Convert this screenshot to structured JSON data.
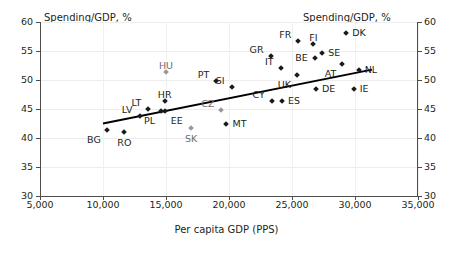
{
  "chart_data": {
    "type": "scatter",
    "title": "",
    "xlabel": "Per capita GDP (PPS)",
    "ylabel": "Spending/GDP, %",
    "ylabel_right": "Spending/GDP, %",
    "xlim": [
      5000,
      35000
    ],
    "ylim": [
      30,
      60
    ],
    "grid": true,
    "legend": "none",
    "xticks": [
      "5,000",
      "10,000",
      "15,000",
      "20,000",
      "25,000",
      "30,000",
      "35,000"
    ],
    "xtick_values": [
      5000,
      10000,
      15000,
      20000,
      25000,
      30000,
      35000
    ],
    "yticks": [
      "30",
      "35",
      "40",
      "45",
      "50",
      "55",
      "60"
    ],
    "ytick_values": [
      30,
      35,
      40,
      45,
      50,
      55,
      60
    ],
    "yticks_right": [
      "30",
      "35",
      "40",
      "45",
      "50",
      "55",
      "60"
    ],
    "series": [
      {
        "name": "EU countries",
        "marker": "diamond",
        "color": "#1a1a1a",
        "points": [
          {
            "label": "BG",
            "x": 10300,
            "y": 41.4,
            "label_pos": "below-left",
            "shade": "dark"
          },
          {
            "label": "RO",
            "x": 11700,
            "y": 41.1,
            "label_pos": "below",
            "shade": "dark"
          },
          {
            "label": "LV",
            "x": 12900,
            "y": 43.8,
            "label_pos": "above-left",
            "shade": "dark"
          },
          {
            "label": "LT",
            "x": 13600,
            "y": 45.0,
            "label_pos": "above-left",
            "shade": "dark"
          },
          {
            "label": "PL",
            "x": 14600,
            "y": 44.7,
            "label_pos": "below-left",
            "shade": "dark"
          },
          {
            "label": "EE",
            "x": 14900,
            "y": 44.6,
            "label_pos": "below-right",
            "shade": "dark"
          },
          {
            "label": "HR",
            "x": 14900,
            "y": 46.3,
            "label_pos": "above",
            "shade": "dark"
          },
          {
            "label": "HU",
            "x": 15000,
            "y": 51.4,
            "label_pos": "above",
            "shade": "light"
          },
          {
            "label": "SK",
            "x": 17000,
            "y": 41.7,
            "label_pos": "below",
            "shade": "light"
          },
          {
            "label": "PT",
            "x": 19000,
            "y": 49.9,
            "label_pos": "above-left",
            "shade": "dark"
          },
          {
            "label": "CZ",
            "x": 19400,
            "y": 44.8,
            "label_pos": "above-left",
            "shade": "light"
          },
          {
            "label": "MT",
            "x": 19800,
            "y": 42.5,
            "label_pos": "right",
            "shade": "dark"
          },
          {
            "label": "SI",
            "x": 20200,
            "y": 48.8,
            "label_pos": "above-left",
            "shade": "dark"
          },
          {
            "label": "GR",
            "x": 23300,
            "y": 54.1,
            "label_pos": "above-left",
            "shade": "dark"
          },
          {
            "label": "CY",
            "x": 23400,
            "y": 46.3,
            "label_pos": "above-left",
            "shade": "dark"
          },
          {
            "label": "IT",
            "x": 24100,
            "y": 52.0,
            "label_pos": "above-left",
            "shade": "dark"
          },
          {
            "label": "ES",
            "x": 24200,
            "y": 46.3,
            "label_pos": "right",
            "shade": "dark"
          },
          {
            "label": "UK",
            "x": 25400,
            "y": 50.9,
            "label_pos": "below-left",
            "shade": "dark"
          },
          {
            "label": "FR",
            "x": 25500,
            "y": 56.8,
            "label_pos": "above-left",
            "shade": "dark"
          },
          {
            "label": "FI",
            "x": 26700,
            "y": 56.2,
            "label_pos": "above",
            "shade": "dark"
          },
          {
            "label": "BE",
            "x": 26800,
            "y": 53.8,
            "label_pos": "left",
            "shade": "dark"
          },
          {
            "label": "DE",
            "x": 26900,
            "y": 48.4,
            "label_pos": "right",
            "shade": "dark"
          },
          {
            "label": "SE",
            "x": 27400,
            "y": 54.7,
            "label_pos": "right",
            "shade": "dark"
          },
          {
            "label": "AT",
            "x": 29000,
            "y": 52.7,
            "label_pos": "below-left",
            "shade": "dark"
          },
          {
            "label": "DK",
            "x": 29300,
            "y": 58.1,
            "label_pos": "right",
            "shade": "dark"
          },
          {
            "label": "IE",
            "x": 29900,
            "y": 48.4,
            "label_pos": "right",
            "shade": "dark"
          },
          {
            "label": "NL",
            "x": 30300,
            "y": 51.7,
            "label_pos": "right",
            "shade": "dark"
          }
        ]
      }
    ],
    "trendline": {
      "type": "linear",
      "color": "#000000",
      "x_start": 10000,
      "y_start": 42.5,
      "x_end": 31350,
      "y_end": 51.8
    }
  }
}
